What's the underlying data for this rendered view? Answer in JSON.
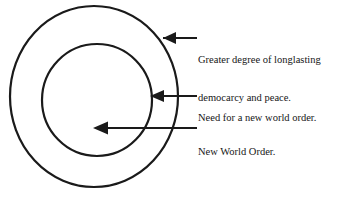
{
  "diagram": {
    "type": "concentric-circles-annotated",
    "background_color": "#ffffff",
    "stroke_color": "#1a1a1a",
    "text_color": "#161616",
    "canvas": {
      "width": 345,
      "height": 204
    },
    "circles": [
      {
        "name": "outer-circle",
        "center_x": 94,
        "center_y": 96.5,
        "radius": 84,
        "stroke_width": 2.2,
        "fill": "none"
      },
      {
        "name": "inner-circle",
        "center_x": 97,
        "center_y": 100,
        "radius": 56,
        "stroke_width": 2.2,
        "fill": "none"
      }
    ],
    "arrows": [
      {
        "name": "arrow-outer-ring",
        "tip_x": 154,
        "tip_y": 38,
        "tail_x": 197,
        "tail_y": 38,
        "target": "outer-ring"
      },
      {
        "name": "arrow-inner-edge",
        "tip_x": 150,
        "tip_y": 96,
        "tail_x": 197,
        "tail_y": 96,
        "target": "inner-circle-edge"
      },
      {
        "name": "arrow-core",
        "tip_x": 94,
        "tip_y": 128,
        "tail_x": 197,
        "tail_y": 128,
        "target": "inner-circle-core"
      }
    ],
    "labels": {
      "outer": {
        "line1": "Greater degree of longlasting",
        "line2": "democarcy and peace."
      },
      "middle": {
        "line1": "Need for a new world order."
      },
      "inner": {
        "line1": "New World Order."
      }
    }
  }
}
